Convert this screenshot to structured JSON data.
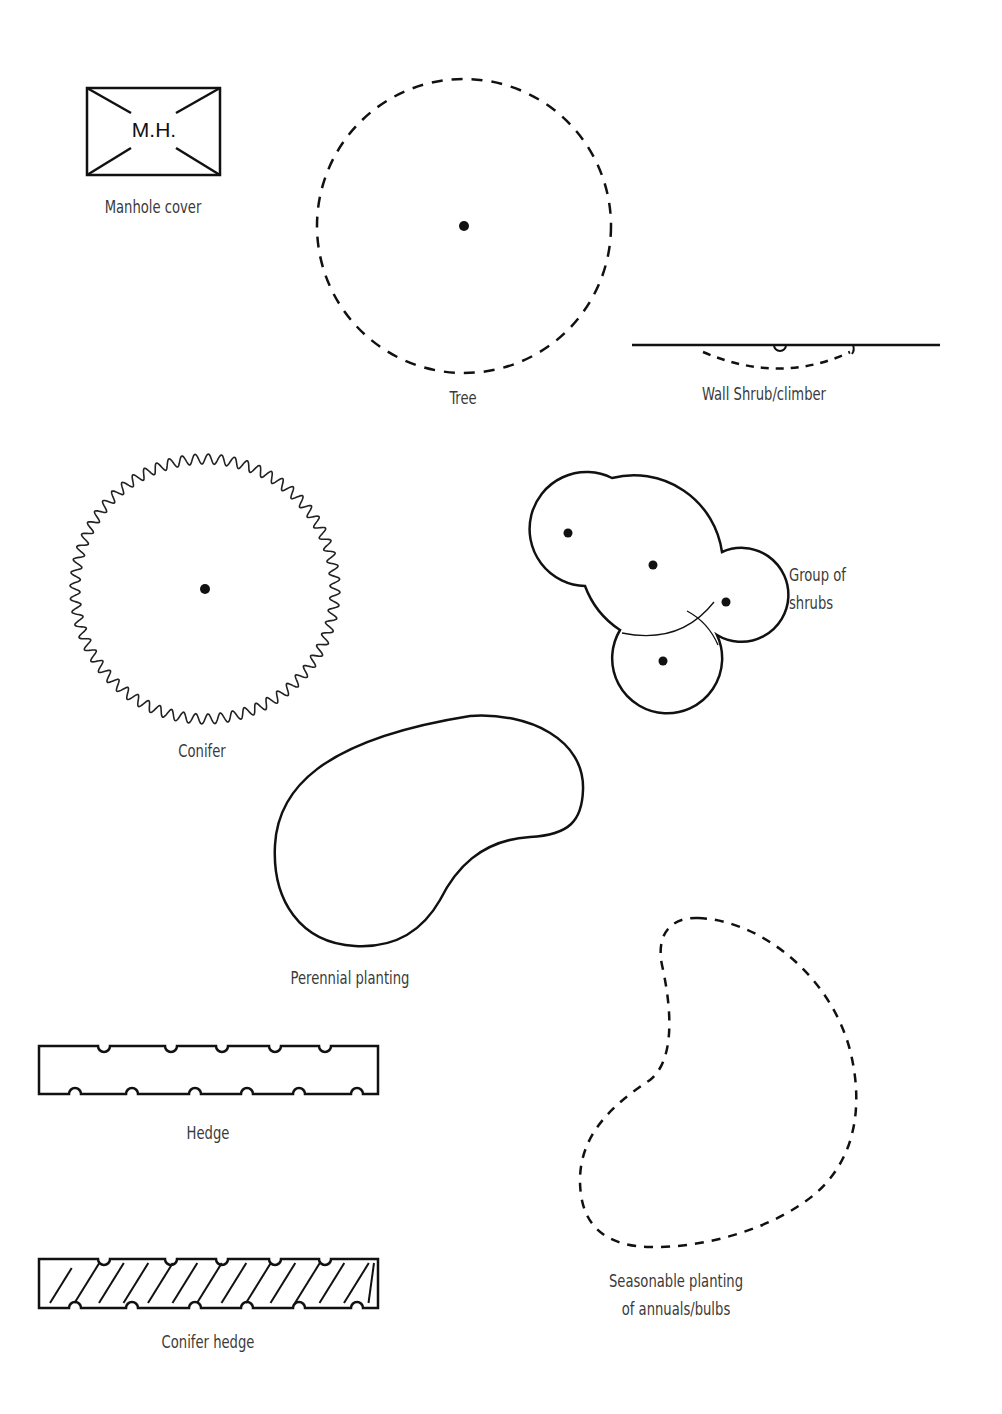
{
  "diagram": {
    "title": "",
    "background": "#ffffff",
    "stroke_color": "#111111",
    "label_color": "#3a3a3a"
  },
  "symbols": {
    "manhole": {
      "label": "Manhole cover",
      "inner_text": "M.H."
    },
    "tree": {
      "label": "Tree"
    },
    "wall_shrub": {
      "label": "Wall Shrub/climber"
    },
    "conifer": {
      "label": "Conifer"
    },
    "shrub_group": {
      "label_line1": "Group of",
      "label_line2": "shrubs"
    },
    "perennial": {
      "label": "Perennial planting"
    },
    "hedge": {
      "label": "Hedge"
    },
    "seasonal": {
      "label_line1": "Seasonable planting",
      "label_line2": "of annuals/bulbs"
    },
    "conifer_hedge": {
      "label": "Conifer hedge"
    }
  }
}
